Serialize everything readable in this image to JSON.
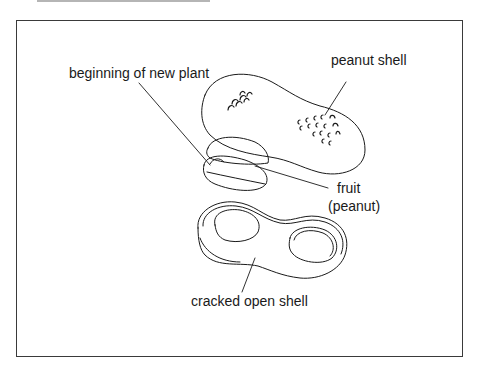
{
  "diagram": {
    "labels": {
      "peanut_shell": "peanut shell",
      "beginning_of_new_plant": "beginning of new plant",
      "fruit_line1": "fruit",
      "fruit_line2": "(peanut)",
      "cracked_open_shell": "cracked open shell"
    },
    "colors": {
      "line": "#1a1a1a",
      "frame": "#3a3a3a",
      "background": "#ffffff"
    }
  }
}
